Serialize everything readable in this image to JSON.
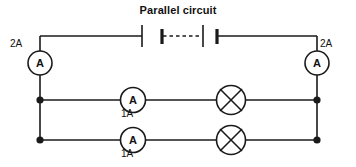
{
  "title": "Parallel circuit",
  "diagram": {
    "type": "electrical-circuit-schematic",
    "stroke_color": "#1a1a1a",
    "background_color": "#ffffff",
    "components": {
      "battery": {
        "name": "battery",
        "cells": 2,
        "label": ""
      },
      "ammeters": [
        {
          "name": "main-ammeter-left",
          "symbol": "A",
          "reading": "2A"
        },
        {
          "name": "main-ammeter-right",
          "symbol": "A",
          "reading": "2A"
        },
        {
          "name": "branch-ammeter-top",
          "symbol": "A",
          "reading": "1A"
        },
        {
          "name": "branch-ammeter-bottom",
          "symbol": "A",
          "reading": "1A"
        }
      ],
      "lamps": [
        {
          "name": "lamp-top"
        },
        {
          "name": "lamp-bottom"
        }
      ],
      "junction_nodes": 4
    }
  },
  "labels": {
    "left_ammeter_reading": "2A",
    "right_ammeter_reading": "2A",
    "branch_top_reading": "1A",
    "branch_bottom_reading": "1A",
    "ammeter_symbol": "A"
  }
}
